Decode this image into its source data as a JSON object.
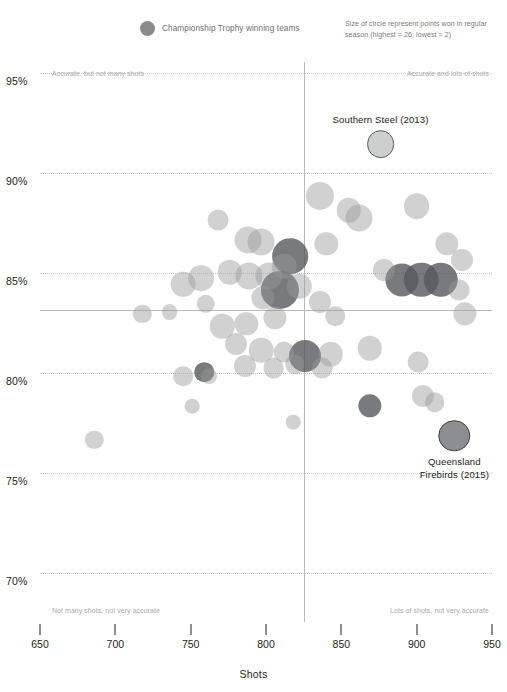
{
  "legend": {
    "swatch_icon": "filled-circle-icon",
    "label": "Championship Trophy winning teams"
  },
  "size_note": "Size of circle represent points won in regular season (highest = 26; lowest = 2)",
  "quadrant_labels": {
    "top_left": "Accurate, but not many shots",
    "top_right": "Accurate and lots of shots",
    "bottom_left": "Not many shots, not very accurate",
    "bottom_right": "Lots of shots, not very accurate"
  },
  "annotations": [
    {
      "id": "southern-steel",
      "line1": "Southern Steel (2013)",
      "line2": ""
    },
    {
      "id": "queensland-firebirds",
      "line1": "Queensland",
      "line2": "Firebirds (2015)"
    }
  ],
  "colors": {
    "normal_bubble": "#98999c",
    "winner_bubble": "#58595b",
    "gridline": "#c9c9cb",
    "crosshair": "#b9babc",
    "text": "#231f20",
    "muted_text": "#a8a9ac"
  },
  "chart_data": {
    "type": "scatter",
    "title": "",
    "xlabel": "Shots",
    "ylabel": "",
    "xlim": [
      650,
      950
    ],
    "ylim": [
      68.0,
      96.0
    ],
    "grid": true,
    "legend_position": "top-center",
    "xticks": [
      650,
      700,
      750,
      800,
      850,
      900,
      950
    ],
    "yticks": [
      "95%",
      "90%",
      "85%",
      "80%",
      "75%",
      "70%"
    ],
    "ytick_values": [
      95,
      90,
      85,
      80,
      75,
      70
    ],
    "reference_lines": {
      "x": 825,
      "y": 83.6
    },
    "size_encoding": {
      "field": "points won in regular season",
      "highest": 26,
      "lowest": 2
    },
    "series": [
      {
        "name": "Championship Trophy winning teams",
        "color": "#58595b",
        "points": [
          {
            "x": 816,
            "y": 86.3,
            "size": 22
          },
          {
            "x": 809,
            "y": 84.6,
            "size": 24
          },
          {
            "x": 826,
            "y": 81.3,
            "size": 19
          },
          {
            "x": 890,
            "y": 85.1,
            "size": 20
          },
          {
            "x": 903,
            "y": 85.1,
            "size": 21
          },
          {
            "x": 916,
            "y": 85.1,
            "size": 21
          },
          {
            "x": 759,
            "y": 80.5,
            "size": 9
          },
          {
            "x": 869,
            "y": 78.8,
            "size": 12
          }
        ]
      },
      {
        "name": "Other teams",
        "color": "#98999c",
        "points": [
          {
            "x": 836,
            "y": 89.3,
            "size": 16
          },
          {
            "x": 855,
            "y": 88.6,
            "size": 13
          },
          {
            "x": 862,
            "y": 88.2,
            "size": 15
          },
          {
            "x": 900,
            "y": 88.8,
            "size": 14
          },
          {
            "x": 768,
            "y": 88.1,
            "size": 10
          },
          {
            "x": 788,
            "y": 87.1,
            "size": 15
          },
          {
            "x": 797,
            "y": 87.0,
            "size": 15
          },
          {
            "x": 840,
            "y": 86.9,
            "size": 12
          },
          {
            "x": 920,
            "y": 86.9,
            "size": 12
          },
          {
            "x": 757,
            "y": 85.2,
            "size": 14
          },
          {
            "x": 776,
            "y": 85.5,
            "size": 13
          },
          {
            "x": 789,
            "y": 85.3,
            "size": 15
          },
          {
            "x": 802,
            "y": 85.3,
            "size": 15
          },
          {
            "x": 812,
            "y": 85.8,
            "size": 13
          },
          {
            "x": 878,
            "y": 85.6,
            "size": 11
          },
          {
            "x": 930,
            "y": 86.1,
            "size": 11
          },
          {
            "x": 745,
            "y": 84.9,
            "size": 13
          },
          {
            "x": 760,
            "y": 83.9,
            "size": 8
          },
          {
            "x": 798,
            "y": 84.2,
            "size": 12
          },
          {
            "x": 822,
            "y": 84.8,
            "size": 13
          },
          {
            "x": 836,
            "y": 84.0,
            "size": 11
          },
          {
            "x": 928,
            "y": 84.6,
            "size": 10
          },
          {
            "x": 718,
            "y": 83.4,
            "size": 8
          },
          {
            "x": 771,
            "y": 82.8,
            "size": 13
          },
          {
            "x": 787,
            "y": 82.9,
            "size": 12
          },
          {
            "x": 806,
            "y": 83.2,
            "size": 12
          },
          {
            "x": 846,
            "y": 83.3,
            "size": 9
          },
          {
            "x": 932,
            "y": 83.4,
            "size": 12
          },
          {
            "x": 736,
            "y": 83.5,
            "size": 6
          },
          {
            "x": 780,
            "y": 81.9,
            "size": 11
          },
          {
            "x": 797,
            "y": 81.6,
            "size": 13
          },
          {
            "x": 812,
            "y": 81.5,
            "size": 10
          },
          {
            "x": 843,
            "y": 81.4,
            "size": 13
          },
          {
            "x": 869,
            "y": 81.7,
            "size": 13
          },
          {
            "x": 786,
            "y": 80.8,
            "size": 11
          },
          {
            "x": 805,
            "y": 80.7,
            "size": 10
          },
          {
            "x": 819,
            "y": 80.9,
            "size": 9
          },
          {
            "x": 837,
            "y": 80.7,
            "size": 10
          },
          {
            "x": 901,
            "y": 81.0,
            "size": 10
          },
          {
            "x": 745,
            "y": 80.3,
            "size": 9
          },
          {
            "x": 762,
            "y": 80.3,
            "size": 6
          },
          {
            "x": 751,
            "y": 78.8,
            "size": 5
          },
          {
            "x": 904,
            "y": 79.3,
            "size": 11
          },
          {
            "x": 912,
            "y": 79.0,
            "size": 9
          },
          {
            "x": 686,
            "y": 77.1,
            "size": 8
          },
          {
            "x": 818,
            "y": 78.0,
            "size": 5
          }
        ]
      }
    ],
    "highlighted_points": [
      {
        "label": "Southern Steel (2013)",
        "x": 876,
        "y": 91.9,
        "size": 14,
        "style": "light-outlined"
      },
      {
        "label": "Queensland Firebirds (2015)",
        "x": 925,
        "y": 77.3,
        "size": 17,
        "style": "dark-outlined"
      }
    ]
  }
}
